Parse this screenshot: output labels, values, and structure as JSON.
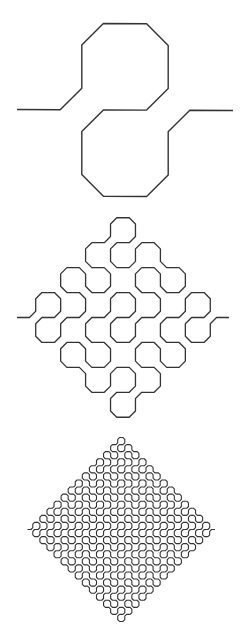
{
  "diagram": {
    "type": "l-system-curve-iterations",
    "curve_name": "Peano curve",
    "axiom": "F",
    "rules": {
      "F": "F+F-F-F-F+F+F+F-F"
    },
    "turn_angle_deg": 90,
    "corner_cut_fraction": 0.25,
    "stroke_color": "#333333",
    "figures": [
      {
        "id": "iteration-1",
        "level": 1,
        "start": [
          17,
          109.5
        ],
        "end": [
          233,
          110.5
        ],
        "stroke_width": 1.4
      },
      {
        "id": "iteration-2",
        "level": 2,
        "start": [
          17,
          317.5
        ],
        "end": [
          229,
          317.5
        ],
        "stroke_width": 1.3
      },
      {
        "id": "iteration-3",
        "level": 3,
        "start": [
          27.5,
          529.5
        ],
        "end": [
          215,
          529.5
        ],
        "stroke_width": 1.1
      }
    ]
  }
}
